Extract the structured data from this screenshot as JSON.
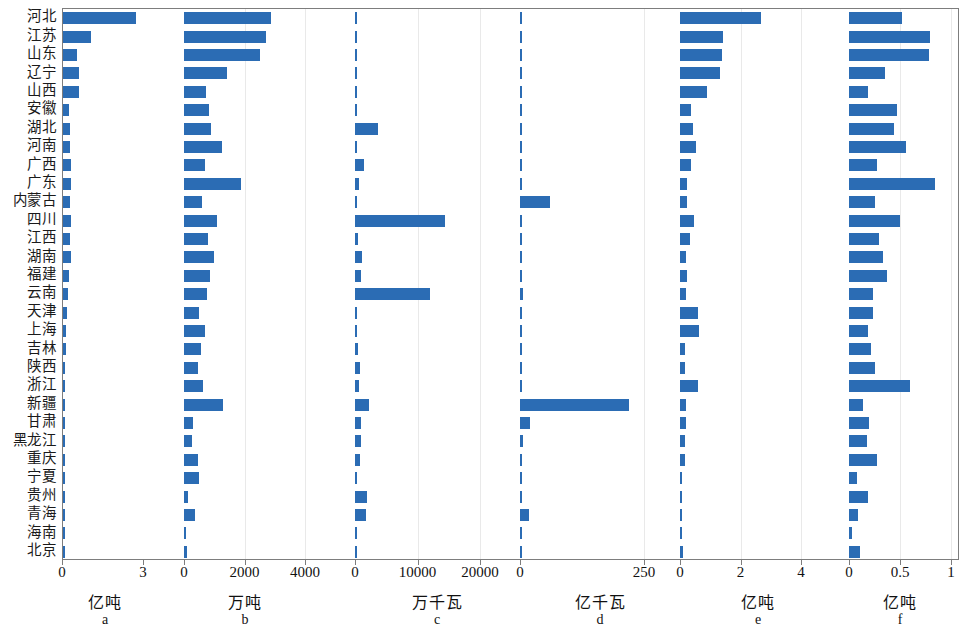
{
  "figure": {
    "accent_color": "#2b6cb4",
    "axis_color": "#7d7d7d",
    "grid_color": "#e9e9e9",
    "categories": [
      "河北",
      "江苏",
      "山东",
      "辽宁",
      "山西",
      "安徽",
      "湖北",
      "河南",
      "广西",
      "广东",
      "内蒙古",
      "四川",
      "江西",
      "湖南",
      "福建",
      "云南",
      "天津",
      "上海",
      "吉林",
      "陕西",
      "浙江",
      "新疆",
      "甘肃",
      "黑龙江",
      "重庆",
      "宁夏",
      "贵州",
      "青海",
      "海南",
      "北京"
    ]
  },
  "chart_data": [
    {
      "key": "a",
      "type": "bar",
      "orientation": "horizontal",
      "title": "",
      "xlabel": "亿吨",
      "ylabel": "",
      "unit": "亿吨",
      "xlim": [
        0,
        3.4
      ],
      "ticks": [
        0,
        3
      ],
      "ticklabels": [
        "0",
        "3"
      ],
      "grid": false,
      "categories": [
        "河北",
        "江苏",
        "山东",
        "辽宁",
        "山西",
        "安徽",
        "湖北",
        "河南",
        "广西",
        "广东",
        "内蒙古",
        "四川",
        "江西",
        "湖南",
        "福建",
        "云南",
        "天津",
        "上海",
        "吉林",
        "陕西",
        "浙江",
        "新疆",
        "甘肃",
        "黑龙江",
        "重庆",
        "宁夏",
        "贵州",
        "青海",
        "海南",
        "北京"
      ],
      "values": [
        2.72,
        1.05,
        0.52,
        0.6,
        0.58,
        0.22,
        0.27,
        0.25,
        0.3,
        0.3,
        0.27,
        0.28,
        0.25,
        0.28,
        0.22,
        0.17,
        0.14,
        0.12,
        0.1,
        0.09,
        0.09,
        0.07,
        0.06,
        0.06,
        0.05,
        0.04,
        0.03,
        0.03,
        0.02,
        0.02
      ]
    },
    {
      "key": "b",
      "type": "bar",
      "orientation": "horizontal",
      "title": "",
      "xlabel": "万吨",
      "ylabel": "",
      "unit": "万吨",
      "xlim": [
        0,
        5600
      ],
      "ticks": [
        0,
        2000,
        4000
      ],
      "ticklabels": [
        "0",
        "2000",
        "4000"
      ],
      "grid": true,
      "categories": [
        "河北",
        "江苏",
        "山东",
        "辽宁",
        "山西",
        "安徽",
        "湖北",
        "河南",
        "广西",
        "广东",
        "内蒙古",
        "四川",
        "江西",
        "湖南",
        "福建",
        "云南",
        "天津",
        "上海",
        "吉林",
        "陕西",
        "浙江",
        "新疆",
        "甘肃",
        "黑龙江",
        "重庆",
        "宁夏",
        "贵州",
        "青海",
        "海南",
        "北京"
      ],
      "values": [
        2880,
        2700,
        2520,
        1430,
        740,
        830,
        880,
        1250,
        690,
        1880,
        580,
        1080,
        800,
        980,
        860,
        770,
        480,
        700,
        560,
        450,
        620,
        1280,
        310,
        250,
        470,
        480,
        130,
        380,
        80,
        110
      ]
    },
    {
      "key": "c",
      "type": "bar",
      "orientation": "horizontal",
      "title": "",
      "xlabel": "万千瓦",
      "ylabel": "",
      "unit": "万千瓦",
      "xlim": [
        0,
        27000
      ],
      "ticks": [
        0,
        10000,
        20000
      ],
      "ticklabels": [
        "0",
        "10000",
        "20000"
      ],
      "grid": true,
      "categories": [
        "河北",
        "江苏",
        "山东",
        "辽宁",
        "山西",
        "安徽",
        "湖北",
        "河南",
        "广西",
        "广东",
        "内蒙古",
        "四川",
        "江西",
        "湖南",
        "福建",
        "云南",
        "天津",
        "上海",
        "吉林",
        "陕西",
        "浙江",
        "新疆",
        "甘肃",
        "黑龙江",
        "重庆",
        "宁夏",
        "贵州",
        "青海",
        "海南",
        "北京"
      ],
      "values": [
        130,
        110,
        110,
        110,
        130,
        180,
        3700,
        150,
        1500,
        700,
        190,
        14400,
        530,
        1100,
        900,
        12000,
        210,
        80,
        400,
        800,
        600,
        2200,
        1000,
        950,
        800,
        300,
        1900,
        1700,
        250,
        120
      ]
    },
    {
      "key": "d",
      "type": "bar",
      "orientation": "horizontal",
      "title": "",
      "xlabel": "亿千瓦",
      "ylabel": "",
      "unit": "亿千瓦",
      "xlim": [
        0,
        330
      ],
      "ticks": [
        0,
        250
      ],
      "ticklabels": [
        "0",
        "250"
      ],
      "grid": true,
      "categories": [
        "河北",
        "江苏",
        "山东",
        "辽宁",
        "山西",
        "安徽",
        "湖北",
        "河南",
        "广西",
        "广东",
        "内蒙古",
        "四川",
        "江西",
        "湖南",
        "福建",
        "云南",
        "天津",
        "上海",
        "吉林",
        "陕西",
        "浙江",
        "新疆",
        "甘肃",
        "黑龙江",
        "重庆",
        "宁夏",
        "贵州",
        "青海",
        "海南",
        "北京"
      ],
      "values": [
        1,
        5,
        5,
        1,
        1,
        1,
        1,
        1,
        1,
        5,
        60,
        1,
        1,
        1,
        2,
        6,
        2,
        2,
        3,
        4,
        5,
        220,
        20,
        6,
        1,
        1,
        1,
        18,
        1,
        1
      ]
    },
    {
      "key": "e",
      "type": "bar",
      "orientation": "horizontal",
      "title": "",
      "xlabel": "亿吨",
      "ylabel": "",
      "unit": "亿吨",
      "xlim": [
        0,
        5.6
      ],
      "ticks": [
        0,
        2,
        4
      ],
      "ticklabels": [
        "0",
        "2",
        "4"
      ],
      "grid": true,
      "categories": [
        "河北",
        "江苏",
        "山东",
        "辽宁",
        "山西",
        "安徽",
        "湖北",
        "河南",
        "广西",
        "广东",
        "内蒙古",
        "四川",
        "江西",
        "湖南",
        "福建",
        "云南",
        "天津",
        "上海",
        "吉林",
        "陕西",
        "浙江",
        "新疆",
        "甘肃",
        "黑龙江",
        "重庆",
        "宁夏",
        "贵州",
        "青海",
        "海南",
        "北京"
      ],
      "values": [
        2.68,
        1.42,
        1.39,
        1.32,
        0.88,
        0.36,
        0.44,
        0.52,
        0.38,
        0.24,
        0.22,
        0.46,
        0.34,
        0.2,
        0.22,
        0.19,
        0.6,
        0.62,
        0.16,
        0.17,
        0.58,
        0.2,
        0.21,
        0.17,
        0.16,
        0.05,
        0.04,
        0.04,
        0.03,
        0.1
      ]
    },
    {
      "key": "f",
      "type": "bar",
      "orientation": "horizontal",
      "title": "",
      "xlabel": "亿吨",
      "ylabel": "",
      "unit": "亿吨",
      "xlim": [
        0,
        1.07
      ],
      "ticks": [
        0,
        0.5,
        1
      ],
      "ticklabels": [
        "0",
        "0.5",
        "1"
      ],
      "grid": true,
      "categories": [
        "河北",
        "江苏",
        "山东",
        "辽宁",
        "山西",
        "安徽",
        "湖北",
        "河南",
        "广西",
        "广东",
        "内蒙古",
        "四川",
        "江西",
        "湖南",
        "福建",
        "云南",
        "天津",
        "上海",
        "吉林",
        "陕西",
        "浙江",
        "新疆",
        "甘肃",
        "黑龙江",
        "重庆",
        "宁夏",
        "贵州",
        "青海",
        "海南",
        "北京"
      ],
      "values": [
        0.52,
        0.79,
        0.78,
        0.35,
        0.19,
        0.47,
        0.44,
        0.56,
        0.27,
        0.84,
        0.25,
        0.5,
        0.29,
        0.33,
        0.37,
        0.24,
        0.24,
        0.19,
        0.22,
        0.25,
        0.6,
        0.14,
        0.2,
        0.18,
        0.27,
        0.08,
        0.19,
        0.09,
        0.03,
        0.11
      ]
    }
  ],
  "panels_layout": [
    {
      "key": "a",
      "left": 62,
      "width": 120,
      "zero_px": 0,
      "span_px": 81,
      "unit_x": 105,
      "first": true,
      "last": false
    },
    {
      "key": "b",
      "left": 182,
      "width": 171,
      "zero_px": 2,
      "span_px": 121,
      "unit_x": 245,
      "first": false,
      "last": false
    },
    {
      "key": "c",
      "left": 353,
      "width": 163,
      "zero_px": 2,
      "span_px": 125,
      "unit_x": 437,
      "first": false,
      "last": false
    },
    {
      "key": "d",
      "left": 516,
      "width": 161,
      "zero_px": 4,
      "span_px": 124,
      "unit_x": 600,
      "first": false,
      "last": false
    },
    {
      "key": "e",
      "left": 677,
      "width": 168,
      "zero_px": 3,
      "span_px": 121,
      "unit_x": 758,
      "first": false,
      "last": false
    },
    {
      "key": "f",
      "left": 845,
      "width": 114,
      "zero_px": 4,
      "span_px": 102,
      "unit_x": 900,
      "first": false,
      "last": true
    }
  ]
}
